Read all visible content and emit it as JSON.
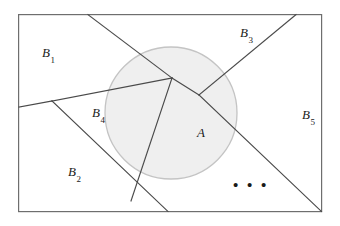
{
  "figure": {
    "kind": "partition-venn-diagram",
    "width": 340,
    "height": 226,
    "background_color": "#ffffff",
    "frame": {
      "x": 18,
      "y": 14,
      "width": 304,
      "height": 198,
      "stroke_color": "#6e6e6e",
      "stroke_width": 1.2,
      "fill_color": "#ffffff"
    },
    "circle": {
      "label": "A",
      "cx": 171,
      "cy": 113,
      "r": 66,
      "fill_color": "#efefef",
      "stroke_color": "#c4c4c4",
      "stroke_width": 1.3
    },
    "partition_lines": {
      "stroke_color": "#4a4a4a",
      "stroke_width": 1.1,
      "segments": [
        {
          "name": "top-left-to-apex",
          "x1": 88,
          "y1": 14,
          "x2": 172,
          "y2": 78
        },
        {
          "name": "apex-to-notch",
          "x1": 172,
          "y1": 78,
          "x2": 199,
          "y2": 95
        },
        {
          "name": "notch-to-top-right",
          "x1": 199,
          "y1": 95,
          "x2": 296,
          "y2": 14
        },
        {
          "name": "apex-down-to-bottom",
          "x1": 172,
          "y1": 78,
          "x2": 131,
          "y2": 201
        },
        {
          "name": "left-border-to-branch",
          "x1": 18,
          "y1": 107,
          "x2": 52,
          "y2": 101
        },
        {
          "name": "branch-to-apex",
          "x1": 52,
          "y1": 101,
          "x2": 172,
          "y2": 78
        },
        {
          "name": "branch-to-bottom-border",
          "x1": 52,
          "y1": 101,
          "x2": 168,
          "y2": 212
        },
        {
          "name": "notch-to-bottom-right-corner",
          "x1": 199,
          "y1": 95,
          "x2": 322,
          "y2": 212
        }
      ]
    },
    "labels": [
      {
        "id": "label-a",
        "base": "A",
        "sub": "",
        "x": 197,
        "y": 126,
        "italic": true
      },
      {
        "id": "label-b1",
        "base": "B",
        "sub": "1",
        "x": 42,
        "y": 46,
        "italic": true
      },
      {
        "id": "label-b2",
        "base": "B",
        "sub": "2",
        "x": 68,
        "y": 165,
        "italic": true
      },
      {
        "id": "label-b3",
        "base": "B",
        "sub": "3",
        "x": 240,
        "y": 26,
        "italic": true
      },
      {
        "id": "label-b4",
        "base": "B",
        "sub": "4",
        "x": 92,
        "y": 106,
        "italic": true
      },
      {
        "id": "label-b5",
        "base": "B",
        "sub": "5",
        "x": 302,
        "y": 108,
        "italic": true
      }
    ],
    "ellipsis": {
      "text": "• • •",
      "x": 233,
      "y": 178
    }
  }
}
